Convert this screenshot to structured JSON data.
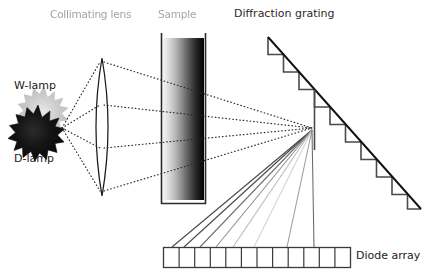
{
  "diagram": {
    "background_color": "#ffffff",
    "width": 435,
    "height": 278
  },
  "labels": {
    "collimating_lens": "Collimating lens",
    "sample": "Sample",
    "diffraction_grating": "Diffraction grating",
    "w_lamp": "W-lamp",
    "d_lamp": "D-lamp",
    "diode_array": "Diode array"
  },
  "components": {
    "w_lamp": {
      "name": "W-lamp",
      "shape": "starburst",
      "fill": "#c9c9c9",
      "center": [
        42,
        110
      ],
      "outer_radius": 23,
      "inner_radius": 12,
      "points": 16
    },
    "d_lamp": {
      "name": "D-lamp",
      "shape": "starburst",
      "fill": "#1a1a1a",
      "center": [
        36,
        131
      ],
      "outer_radius": 25,
      "inner_radius": 13,
      "points": 16
    },
    "collimating_lens": {
      "name": "Collimating lens",
      "shape": "biconvex-lens",
      "center_x": 102,
      "top_y": 58,
      "bottom_y": 196,
      "half_width": 11,
      "stroke": "#1a1a1a"
    },
    "sample_cell": {
      "name": "Sample cuvette",
      "shape": "rectangle-with-gradient",
      "x": 159,
      "y": 33,
      "width": 48,
      "height": 171,
      "gradient_from": "#f2f2f2",
      "gradient_to": "#050505",
      "wall_stroke": "#2b2b2b"
    },
    "diffraction_grating": {
      "name": "Diffraction grating",
      "shape": "sawtooth-staircase",
      "start": [
        268,
        37
      ],
      "end": [
        420,
        208
      ],
      "teeth": 10,
      "stroke": "#2b2b2b",
      "hypotenuse_stroke": "#111111",
      "focus_point": [
        312,
        128
      ]
    },
    "diode_array": {
      "name": "Diode array",
      "shape": "row-of-cells",
      "x": 163,
      "y": 247,
      "width": 188,
      "height": 21,
      "cells": 12,
      "stroke": "#3a3a3a",
      "fill": "#ffffff"
    }
  },
  "rays": {
    "source_point": [
      62,
      128
    ],
    "incident_dotted": {
      "style": "dotted",
      "color": "#2a2a2a",
      "count": 4,
      "description": "Light from lamps through collimating lens and sample to grating"
    },
    "diffracted_solid": {
      "style": "solid",
      "count": 8,
      "description": "Dispersed spectrum from grating to diode array",
      "colors": [
        "#4a4a4a",
        "#4a4a4a",
        "#6e6e6e",
        "#8f8f8f",
        "#b8b8b8",
        "#cfcfcf",
        "#9a9a9a",
        "#6a6a6a"
      ],
      "targets": [
        172,
        186,
        200,
        216,
        232,
        252,
        285,
        315
      ]
    }
  }
}
